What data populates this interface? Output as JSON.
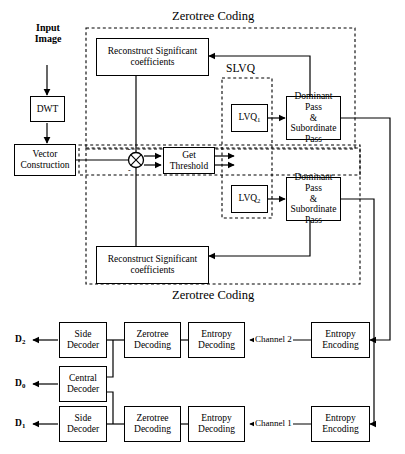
{
  "figure": {
    "title_top": "Zerotree Coding",
    "title_bottom": "Zerotree Coding",
    "slvq_label": "SLVQ"
  },
  "input": {
    "label_line1": "Input",
    "label_line2": "Image"
  },
  "encoder": {
    "dwt": "DWT",
    "vector_construction_line1": "Vector",
    "vector_construction_line2": "Construction",
    "reconstruct_top_line1": "Reconstruct Significant",
    "reconstruct_top_line2": "coefficients",
    "reconstruct_bottom_line1": "Reconstruct Significant",
    "reconstruct_bottom_line2": "coefficients",
    "get_threshold_line1": "Get",
    "get_threshold_line2": "Threshold",
    "lvq1": "LVQ",
    "lvq1_sub": "1",
    "lvq2": "LVQ",
    "lvq2_sub": "2",
    "dominant_pass_1_line1": "Dominant Pass",
    "dominant_pass_1_line2": "& Subordinate",
    "dominant_pass_1_line3": "Pass",
    "dominant_pass_2_line1": "Dominant Pass",
    "dominant_pass_2_line2": "& Subordinate",
    "dominant_pass_2_line3": "Pass",
    "sum_plus_top": "-",
    "sum_plus_bottom": "-"
  },
  "channels": {
    "channel_2": "Channel 2",
    "channel_1": "Channel 1"
  },
  "decoder": {
    "entropy_encoding_2_line1": "Entropy",
    "entropy_encoding_2_line2": "Encoding",
    "entropy_encoding_1_line1": "Entropy",
    "entropy_encoding_1_line2": "Encoding",
    "entropy_decoding_2_line1": "Entropy",
    "entropy_decoding_2_line2": "Decoding",
    "entropy_decoding_1_line1": "Entropy",
    "entropy_decoding_1_line2": "Decoding",
    "zerotree_decoding_2_line1": "Zerotree",
    "zerotree_decoding_2_line2": "Decoding",
    "zerotree_decoding_1_line1": "Zerotree",
    "zerotree_decoding_1_line2": "Decoding",
    "side_decoder_2_line1": "Side",
    "side_decoder_2_line2": "Decoder",
    "side_decoder_1_line1": "Side",
    "side_decoder_1_line2": "Decoder",
    "central_decoder_line1": "Central",
    "central_decoder_line2": "Decoder"
  },
  "outputs": {
    "d2": "D",
    "d2_sub": "2",
    "d0": "D",
    "d0_sub": "0",
    "d1": "D",
    "d1_sub": "1"
  },
  "colors": {
    "stroke": "#000000",
    "background": "#ffffff"
  }
}
